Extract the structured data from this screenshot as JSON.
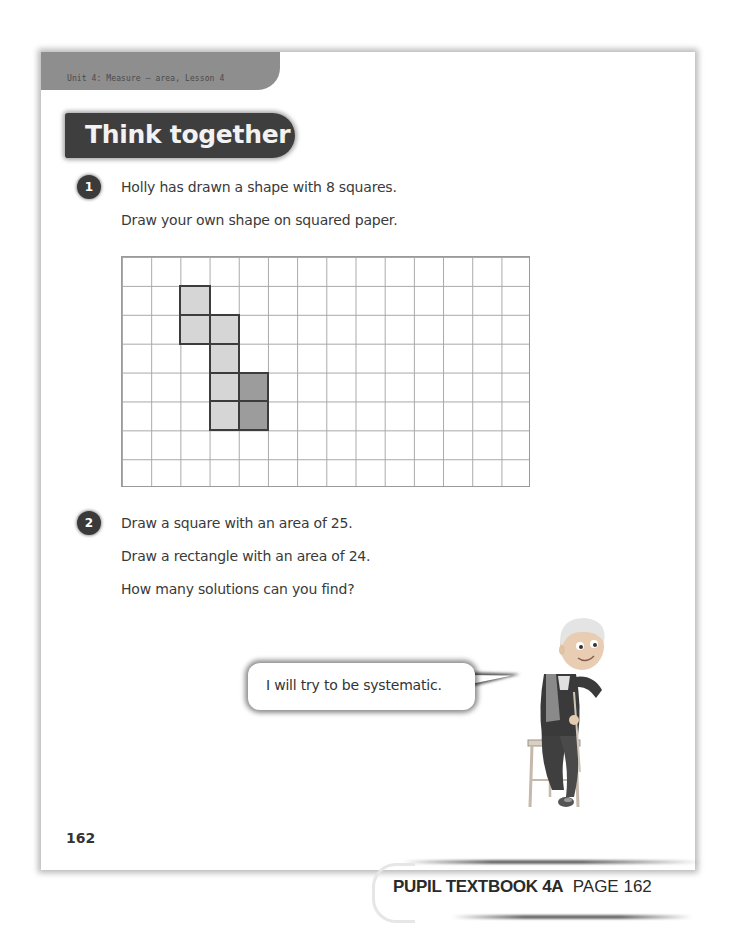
{
  "header": {
    "unit_label": "Unit 4: Measure – area, Lesson 4",
    "section_title": "Think together"
  },
  "questions": [
    {
      "number": "1",
      "lines": [
        "Holly has drawn a shape with 8 squares.",
        "Draw your own shape on squared paper."
      ]
    },
    {
      "number": "2",
      "lines": [
        "Draw a square with an area of 25.",
        "Draw a rectangle with an area of 24.",
        "How many solutions can you find?"
      ]
    }
  ],
  "grid": {
    "columns": 14,
    "rows": 8,
    "shaded_cells": [
      {
        "col": 2,
        "row": 1,
        "shade": "light"
      },
      {
        "col": 2,
        "row": 2,
        "shade": "light"
      },
      {
        "col": 3,
        "row": 2,
        "shade": "light"
      },
      {
        "col": 3,
        "row": 3,
        "shade": "light"
      },
      {
        "col": 3,
        "row": 4,
        "shade": "light"
      },
      {
        "col": 4,
        "row": 4,
        "shade": "dark"
      },
      {
        "col": 3,
        "row": 5,
        "shade": "light"
      },
      {
        "col": 4,
        "row": 5,
        "shade": "dark"
      }
    ]
  },
  "speech_bubble": {
    "text": "I will try to be systematic."
  },
  "character": {
    "description": "boy-sitting-on-stool"
  },
  "page_number": "162",
  "footer": {
    "book_label": "PUPIL TEXTBOOK 4A",
    "page_label": "PAGE 162"
  },
  "colors": {
    "header_band": "#8e8e8e",
    "title_banner": "#3e3e3e",
    "shade_light": "#d6d6d6",
    "shade_dark": "#9c9c9c"
  }
}
